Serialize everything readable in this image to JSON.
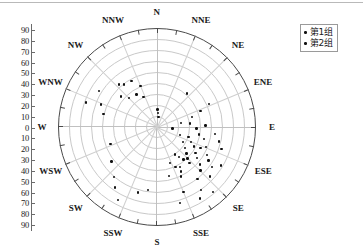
{
  "chart_data": {
    "type": "scatter",
    "projection": "polar-stereonet",
    "title": "",
    "xlabel": "",
    "ylabel": "",
    "radial_axis": {
      "labels": [
        "90",
        "80",
        "70",
        "60",
        "50",
        "40",
        "30",
        "20",
        "10",
        "0",
        "10",
        "20",
        "30",
        "40",
        "50",
        "60",
        "70",
        "80",
        "90"
      ],
      "values": [
        90,
        80,
        70,
        60,
        50,
        40,
        30,
        20,
        10,
        0,
        10,
        20,
        30,
        40,
        50,
        60,
        70,
        80,
        90
      ],
      "range": [
        0,
        90
      ],
      "tick_step": 10
    },
    "compass_labels": [
      "N",
      "NNE",
      "NE",
      "ENE",
      "E",
      "ESE",
      "SE",
      "SSE",
      "S",
      "SSW",
      "SW",
      "WSW",
      "W",
      "WNW",
      "NW",
      "NNW"
    ],
    "grid": true,
    "ring_count": 9,
    "spoke_count": 16,
    "legend": {
      "position": "top-right",
      "entries": [
        {
          "label": "第1组",
          "marker": "dot",
          "color": "#111111"
        },
        {
          "label": "第2组",
          "marker": "dot",
          "color": "#111111"
        }
      ]
    },
    "series": [
      {
        "name": "第1组",
        "color": "#111111",
        "points": [
          {
            "az": 302,
            "r": 62
          },
          {
            "az": 289,
            "r": 68
          },
          {
            "az": 292,
            "r": 55
          },
          {
            "az": 284,
            "r": 50
          },
          {
            "az": 318,
            "r": 52
          },
          {
            "az": 322,
            "r": 49
          },
          {
            "az": 331,
            "r": 48
          },
          {
            "az": 310,
            "r": 43
          },
          {
            "az": 316,
            "r": 37
          },
          {
            "az": 328,
            "r": 35
          },
          {
            "az": 338,
            "r": 40
          },
          {
            "az": 336,
            "r": 30
          },
          {
            "az": 2,
            "r": 16
          },
          {
            "az": 5,
            "r": 13
          },
          {
            "az": 8,
            "r": 9
          },
          {
            "az": 42,
            "r": 41
          },
          {
            "az": 250,
            "r": 45
          },
          {
            "az": 233,
            "r": 52
          },
          {
            "az": 221,
            "r": 60
          },
          {
            "az": 215,
            "r": 67
          },
          {
            "az": 208,
            "r": 75
          },
          {
            "az": 196,
            "r": 62
          },
          {
            "az": 188,
            "r": 58
          }
        ]
      },
      {
        "name": "第2组",
        "color": "#111111",
        "points": [
          {
            "az": 96,
            "r": 14
          },
          {
            "az": 110,
            "r": 22
          },
          {
            "az": 120,
            "r": 27
          },
          {
            "az": 127,
            "r": 32
          },
          {
            "az": 132,
            "r": 36
          },
          {
            "az": 136,
            "r": 40
          },
          {
            "az": 138,
            "r": 44
          },
          {
            "az": 141,
            "r": 38
          },
          {
            "az": 144,
            "r": 34
          },
          {
            "az": 147,
            "r": 30
          },
          {
            "az": 150,
            "r": 42
          },
          {
            "az": 152,
            "r": 46
          },
          {
            "az": 154,
            "r": 50
          },
          {
            "az": 128,
            "r": 46
          },
          {
            "az": 124,
            "r": 42
          },
          {
            "az": 118,
            "r": 38
          },
          {
            "az": 114,
            "r": 34
          },
          {
            "az": 108,
            "r": 30
          },
          {
            "az": 104,
            "r": 44
          },
          {
            "az": 100,
            "r": 39
          },
          {
            "az": 112,
            "r": 48
          },
          {
            "az": 119,
            "r": 52
          },
          {
            "az": 123,
            "r": 56
          },
          {
            "az": 131,
            "r": 52
          },
          {
            "az": 135,
            "r": 56
          },
          {
            "az": 142,
            "r": 60
          },
          {
            "az": 126,
            "r": 62
          },
          {
            "az": 133,
            "r": 66
          },
          {
            "az": 121,
            "r": 68
          },
          {
            "az": 145,
            "r": 70
          },
          {
            "az": 92,
            "r": 36
          },
          {
            "az": 88,
            "r": 44
          },
          {
            "az": 84,
            "r": 30
          },
          {
            "az": 80,
            "r": 22
          },
          {
            "az": 74,
            "r": 33
          },
          {
            "az": 70,
            "r": 42
          },
          {
            "az": 66,
            "r": 52
          },
          {
            "az": 97,
            "r": 53
          },
          {
            "az": 103,
            "r": 58
          },
          {
            "az": 109,
            "r": 62
          },
          {
            "az": 116,
            "r": 44
          },
          {
            "az": 158,
            "r": 64
          },
          {
            "az": 163,
            "r": 72
          },
          {
            "az": 149,
            "r": 76
          },
          {
            "az": 139,
            "r": 78
          },
          {
            "az": 155,
            "r": 40
          },
          {
            "az": 160,
            "r": 35
          },
          {
            "az": 166,
            "r": 46
          }
        ]
      }
    ]
  }
}
